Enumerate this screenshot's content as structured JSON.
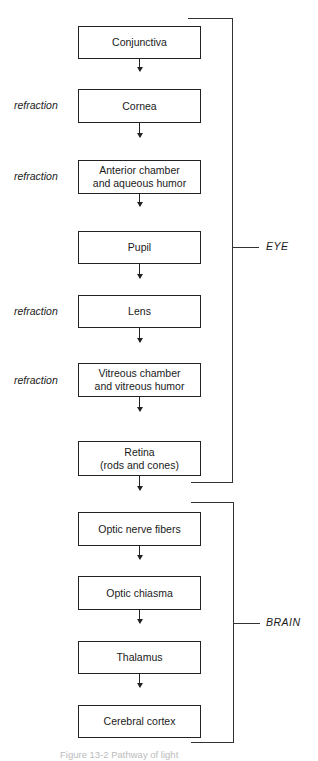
{
  "boxes": [
    {
      "label": "Conjunctiva",
      "side": ""
    },
    {
      "label": "Cornea",
      "side": "refraction"
    },
    {
      "label": "Anterior chamber\nand aqueous humor",
      "side": "refraction"
    },
    {
      "label": "Pupil",
      "side": ""
    },
    {
      "label": "Lens",
      "side": "refraction"
    },
    {
      "label": "Vitreous chamber\nand vitreous humor",
      "side": "refraction"
    },
    {
      "label": "Retina\n(rods and cones)",
      "side": ""
    },
    {
      "label": "Optic nerve fibers",
      "side": ""
    },
    {
      "label": "Optic chiasma",
      "side": ""
    },
    {
      "label": "Thalamus",
      "side": ""
    },
    {
      "label": "Cerebral cortex",
      "side": ""
    }
  ],
  "groups": {
    "eye": {
      "label": "EYE"
    },
    "brain": {
      "label": "BRAIN"
    }
  },
  "caption": "Figure 13-2  Pathway of light"
}
